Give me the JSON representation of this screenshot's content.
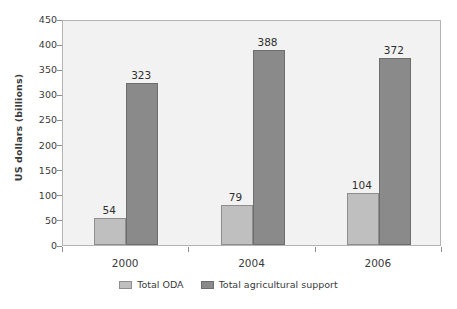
{
  "chart_data": {
    "type": "bar",
    "title": "",
    "subtitle": "",
    "xlabel": "",
    "ylabel": "US dollars (billions)",
    "categories": [
      "2000",
      "2004",
      "2006"
    ],
    "series": [
      {
        "name": "Total ODA",
        "color": "#bfbfbf",
        "values": [
          54,
          79,
          104
        ],
        "labels": [
          "54",
          "79",
          "104"
        ]
      },
      {
        "name": "Total agricultural support",
        "color": "#8a8a8a",
        "values": [
          323,
          388,
          372
        ],
        "labels": [
          "323",
          "388",
          "372"
        ]
      }
    ],
    "ylim": [
      0,
      450
    ],
    "yticks": [
      0,
      50,
      100,
      150,
      200,
      250,
      300,
      350,
      400,
      450
    ],
    "ytick_labels": [
      "0",
      "50",
      "100",
      "150",
      "200",
      "250",
      "300",
      "350",
      "400",
      "450"
    ],
    "grid": false,
    "legend_position": "bottom",
    "plot_background": "#f2f2f2",
    "figure_background": "#ffffff",
    "axis_color": "#8d8d8d",
    "text_color": "#3a3a3a"
  }
}
